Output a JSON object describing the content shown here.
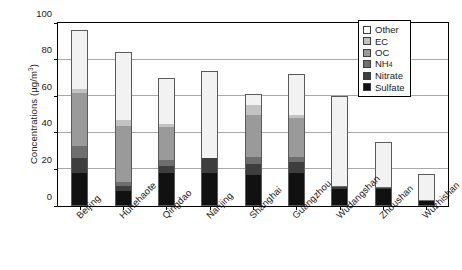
{
  "chart_data": {
    "type": "bar",
    "subtype": "stacked-vertical",
    "title": "",
    "xlabel": "",
    "ylabel": "Concentrations (µg/m³)",
    "ylabel_unit": "µg/m3",
    "ylim": [
      0,
      100
    ],
    "yticks": [
      0,
      20,
      40,
      60,
      80,
      100
    ],
    "ytick_labels": [
      "0",
      "20",
      "40",
      "60",
      "80",
      "100"
    ],
    "grid": true,
    "grid_axis": "y",
    "legend_position": "top-right-inside",
    "categories": [
      "Beijing",
      "Huhehaote",
      "Qingdao",
      "Nanjing",
      "Shanghai",
      "Guangzhou",
      "Wudangshan",
      "Zhoushan",
      "Wuzhishan"
    ],
    "series": [
      {
        "name": "Sulfate",
        "color": "#111111",
        "values": [
          18.0,
          8.0,
          18.0,
          18.0,
          17.0,
          18.0,
          9.5,
          9.5,
          2.5
        ]
      },
      {
        "name": "Nitrate",
        "color": "#3e3e3e",
        "values": [
          8.0,
          3.0,
          4.0,
          8.0,
          6.0,
          6.0,
          1.0,
          0.5,
          0.5
        ]
      },
      {
        "name": "NH4",
        "label": "NH₄",
        "color": "#6e6e6e",
        "values": [
          7.0,
          2.0,
          3.0,
          0.0,
          4.0,
          3.0,
          0.5,
          0.5,
          0.5
        ]
      },
      {
        "name": "OC",
        "color": "#9a9a9a",
        "values": [
          29.0,
          31.0,
          18.0,
          0.0,
          23.0,
          21.0,
          0.0,
          0.0,
          0.0
        ]
      },
      {
        "name": "EC",
        "color": "#c2c2c2",
        "values": [
          2.0,
          3.0,
          2.0,
          0.0,
          5.0,
          2.0,
          0.0,
          0.0,
          0.0
        ]
      },
      {
        "name": "Other",
        "color": "#f2f2f2",
        "values": [
          32.0,
          37.0,
          25.0,
          48.0,
          6.0,
          22.0,
          49.0,
          24.5,
          14.0
        ]
      }
    ],
    "totals": [
      96.0,
      84.0,
      70.0,
      74.0,
      61.0,
      72.0,
      60.0,
      35.0,
      17.5
    ],
    "legend": [
      {
        "label": "Other",
        "color": "#ffffff"
      },
      {
        "label": "EC",
        "color": "#c2c2c2"
      },
      {
        "label": "OC",
        "color": "#9a9a9a"
      },
      {
        "label": "NH4",
        "color": "#6e6e6e",
        "sub": "4",
        "base": "NH"
      },
      {
        "label": "Nitrate",
        "color": "#3e3e3e"
      },
      {
        "label": "Sulfate",
        "color": "#111111"
      }
    ]
  }
}
